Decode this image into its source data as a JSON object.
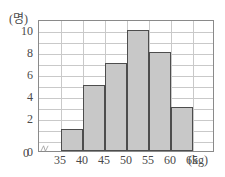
{
  "chart_data": {
    "type": "bar",
    "title": "",
    "subtitle": "",
    "xlabel": "(kg)",
    "ylabel": "(명)",
    "categories": [
      "35~40",
      "40~45",
      "45~50",
      "50~55",
      "55~60",
      "60~65"
    ],
    "bin_edges": [
      35,
      40,
      45,
      50,
      55,
      60,
      65
    ],
    "values": [
      2,
      6,
      8,
      11,
      9,
      4
    ],
    "x_tick_labels": [
      "35",
      "40",
      "45",
      "50",
      "55",
      "60",
      "65"
    ],
    "y_tick_labels": [
      "0",
      "2",
      "4",
      "6",
      "8",
      "10"
    ],
    "y_tick_values": [
      0,
      2,
      4,
      6,
      8,
      10
    ],
    "ylim": [
      0,
      12
    ],
    "xlim": [
      30,
      70
    ],
    "grid": true,
    "grid_step_y": 1,
    "grid_step_x": 5,
    "legend": "none",
    "zero_label": "0",
    "axis_break": true,
    "colors": {
      "bar_fill": "#c8c8c8",
      "bar_edge": "#4d4d4d",
      "grid": "#c9c9c9",
      "frame": "#8a8a8a",
      "text": "#4a4a4a",
      "background": "#ffffff"
    }
  }
}
